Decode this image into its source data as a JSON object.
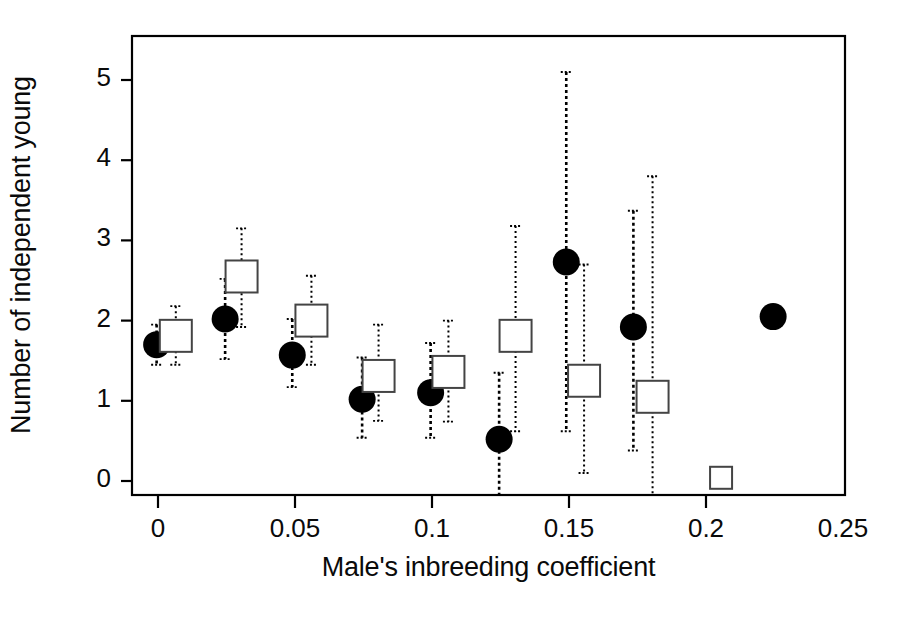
{
  "figure": {
    "background_color": "#ffffff",
    "foreground_color": "#000000",
    "y_axis_title": "Number of independent young",
    "x_axis_title": "Male's inbreeding coefficient"
  },
  "chart_data": {
    "type": "scatter",
    "title": "",
    "xlabel": "Male's inbreeding coefficient",
    "ylabel": "Number of independent young",
    "xlim": [
      -0.0115,
      0.2585
    ],
    "ylim": [
      -0.19,
      5.78
    ],
    "xticks": [
      0,
      0.05,
      0.1,
      0.15,
      0.2,
      0.25
    ],
    "xtick_labels": [
      "0",
      "0.05",
      "0.1",
      "0.15",
      "0.2",
      "0.25"
    ],
    "yticks": [
      0,
      1,
      2,
      3,
      4,
      5
    ],
    "ytick_labels": [
      "0",
      "1",
      "2",
      "3",
      "4",
      "5"
    ],
    "grid": false,
    "legend_position": "none",
    "error_bar_style": "dotted vertical line with short horizontal caps",
    "series": [
      {
        "name": "filled-circle",
        "marker": "filled circle",
        "marker_color": "#000000",
        "points": [
          {
            "x": -0.0005,
            "y": 1.7,
            "y_low": 1.45,
            "y_high": 1.95
          },
          {
            "x": 0.0245,
            "y": 2.02,
            "y_low": 1.52,
            "y_high": 2.52
          },
          {
            "x": 0.049,
            "y": 1.57,
            "y_low": 1.17,
            "y_high": 2.02
          },
          {
            "x": 0.0745,
            "y": 1.02,
            "y_low": 0.54,
            "y_high": 1.54
          },
          {
            "x": 0.0995,
            "y": 1.1,
            "y_low": 0.54,
            "y_high": 1.72
          },
          {
            "x": 0.1245,
            "y": 0.52,
            "y_low": -0.21,
            "y_high": 1.35
          },
          {
            "x": 0.149,
            "y": 2.73,
            "y_low": 0.62,
            "y_high": 5.1
          },
          {
            "x": 0.1735,
            "y": 1.92,
            "y_low": 0.38,
            "y_high": 3.37
          },
          {
            "x": 0.2245,
            "y": 2.05,
            "y_low": null,
            "y_high": null
          }
        ]
      },
      {
        "name": "open-square",
        "marker": "open square",
        "marker_color": "#ffffff",
        "marker_edge_color": "#444444",
        "points": [
          {
            "x": 0.0065,
            "y": 1.81,
            "y_low": 1.45,
            "y_high": 2.18
          },
          {
            "x": 0.0305,
            "y": 2.55,
            "y_low": 1.92,
            "y_high": 3.15
          },
          {
            "x": 0.056,
            "y": 2.0,
            "y_low": 1.45,
            "y_high": 2.56
          },
          {
            "x": 0.0805,
            "y": 1.31,
            "y_low": 0.75,
            "y_high": 1.95
          },
          {
            "x": 0.106,
            "y": 1.36,
            "y_low": 0.74,
            "y_high": 2.0
          },
          {
            "x": 0.1305,
            "y": 1.81,
            "y_low": 0.62,
            "y_high": 3.18
          },
          {
            "x": 0.1555,
            "y": 1.25,
            "y_low": 0.1,
            "y_high": 2.7
          },
          {
            "x": 0.1805,
            "y": 1.05,
            "y_low": -0.19,
            "y_high": 3.8
          },
          {
            "x": 0.2055,
            "y": 0.04,
            "y_low": null,
            "y_high": null
          }
        ]
      }
    ]
  },
  "plot_geometry": {
    "frame_left": 132,
    "frame_right": 845,
    "frame_top": 36,
    "frame_bottom": 495,
    "x_of_0": 158,
    "x_of_0_25": 843,
    "y_of_0": 481,
    "y_of_5": 80
  }
}
